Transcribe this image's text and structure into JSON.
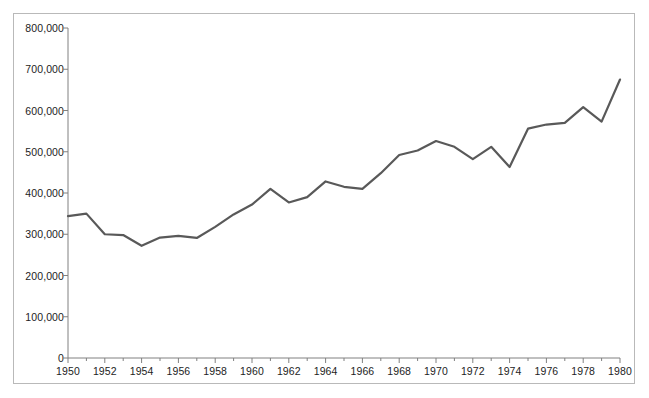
{
  "chart_data": {
    "type": "line",
    "title": "",
    "subtitle": "",
    "xlabel": "",
    "ylabel": "",
    "x": [
      1950,
      1951,
      1952,
      1953,
      1954,
      1955,
      1956,
      1957,
      1958,
      1959,
      1960,
      1961,
      1962,
      1963,
      1964,
      1965,
      1966,
      1967,
      1968,
      1969,
      1970,
      1971,
      1972,
      1973,
      1974,
      1975,
      1976,
      1977,
      1978,
      1979,
      1980
    ],
    "values": [
      344000,
      350000,
      300000,
      298000,
      272000,
      292000,
      296000,
      291000,
      318000,
      348000,
      372000,
      410000,
      377000,
      390000,
      428000,
      415000,
      410000,
      448000,
      492000,
      503000,
      526000,
      512000,
      482000,
      512000,
      463000,
      556000,
      566000,
      570000,
      608000,
      573000,
      675000
    ],
    "xlim": [
      1950,
      1980
    ],
    "ylim": [
      0,
      800000
    ],
    "xticks": [
      1950,
      1951,
      1952,
      1953,
      1954,
      1955,
      1956,
      1957,
      1958,
      1959,
      1960,
      1961,
      1962,
      1963,
      1964,
      1965,
      1966,
      1967,
      1968,
      1969,
      1970,
      1971,
      1972,
      1973,
      1974,
      1975,
      1976,
      1977,
      1978,
      1979,
      1980
    ],
    "xtick_labels": [
      "1950",
      "",
      "1952",
      "",
      "1954",
      "",
      "1956",
      "",
      "1958",
      "",
      "1960",
      "",
      "1962",
      "",
      "1964",
      "",
      "1966",
      "",
      "1968",
      "",
      "1970",
      "",
      "1972",
      "",
      "1974",
      "",
      "1976",
      "",
      "1978",
      "",
      "1980"
    ],
    "yticks": [
      0,
      100000,
      200000,
      300000,
      400000,
      500000,
      600000,
      700000,
      800000
    ],
    "ytick_labels": [
      "0",
      "100,000",
      "200,000",
      "300,000",
      "400,000",
      "500,000",
      "600,000",
      "700,000",
      "800,000"
    ],
    "grid": false,
    "legend": null,
    "series_color": "#595959",
    "axis_color": "#808080",
    "border_color": "#b9b9b9",
    "line_width": 2.2
  }
}
